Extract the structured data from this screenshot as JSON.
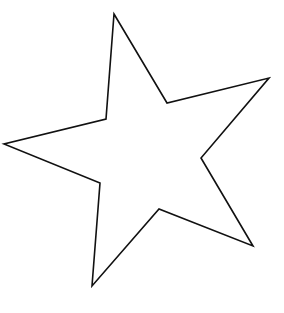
{
  "image": {
    "width": 284,
    "height": 313,
    "background": "#ffffff"
  },
  "star": {
    "shape": "five-pointed-star-outline",
    "stroke": "#111111",
    "stroke_width": 1.6,
    "fill": "#ffffff",
    "points": [
      [
        114,
        14
      ],
      [
        167,
        103
      ],
      [
        269,
        78
      ],
      [
        201,
        158
      ],
      [
        253,
        246
      ],
      [
        159,
        209
      ],
      [
        92,
        286
      ],
      [
        100,
        183
      ],
      [
        4,
        144
      ],
      [
        106,
        119
      ]
    ]
  }
}
